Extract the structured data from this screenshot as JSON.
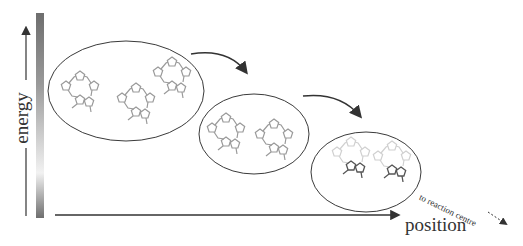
{
  "axes": {
    "y_label": "energy",
    "x_label": "position"
  },
  "annotation": {
    "exit_label": "to reaction centre"
  },
  "colors": {
    "stroke": "#3a3a3a",
    "molecule_light": "#9a9a9a",
    "molecule_faint": "#cfcfcf",
    "molecule_dark": "#555555",
    "gradient_dark": "#6e6e6e",
    "gradient_light": "#f2f2f2"
  },
  "groups": [
    {
      "name": "high-energy-ensemble",
      "molecule_count": 3,
      "shading": "light"
    },
    {
      "name": "intermediate-ensemble",
      "molecule_count": 2,
      "shading": "light"
    },
    {
      "name": "low-energy-ensemble",
      "molecule_count": 2,
      "shading": "partial"
    }
  ],
  "transitions": [
    {
      "from": "high-energy-ensemble",
      "to": "intermediate-ensemble"
    },
    {
      "from": "intermediate-ensemble",
      "to": "low-energy-ensemble"
    }
  ]
}
